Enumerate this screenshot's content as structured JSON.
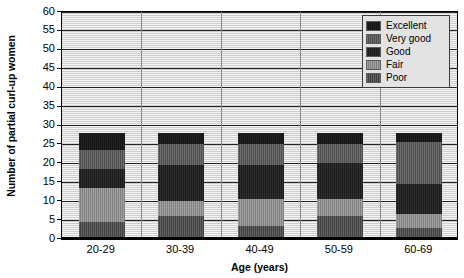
{
  "chart_data": {
    "type": "bar",
    "subtype": "stacked-bar",
    "title": "",
    "xlabel": "Age (years)",
    "ylabel": "Number of partial curl-up women",
    "categories": [
      "20-29",
      "30-39",
      "40-49",
      "50-59",
      "60-69"
    ],
    "ylim": [
      0,
      60
    ],
    "ytick_labels": [
      "0",
      "5",
      "10",
      "15",
      "20",
      "25",
      "30",
      "35",
      "40",
      "45",
      "50",
      "55",
      "60"
    ],
    "ytick_values": [
      0,
      5,
      10,
      15,
      20,
      25,
      30,
      35,
      40,
      45,
      50,
      55,
      60
    ],
    "grid": true,
    "grid_axis": "y",
    "legend_position": "top-right",
    "series": [
      {
        "name": "Poor",
        "color": "#4a4a4a",
        "values": [
          4.0,
          5.5,
          3.0,
          5.5,
          2.5
        ]
      },
      {
        "name": "Fair",
        "color": "#8e8e8e",
        "values": [
          9.0,
          4.0,
          7.0,
          4.5,
          3.5
        ]
      },
      {
        "name": "Good",
        "color": "#1d1d1d",
        "values": [
          5.0,
          9.5,
          9.0,
          9.5,
          8.0
        ]
      },
      {
        "name": "Very good",
        "color": "#565656",
        "values": [
          5.0,
          5.5,
          5.5,
          5.0,
          11.0
        ]
      },
      {
        "name": "Excellent",
        "color": "#151515",
        "values": [
          4.5,
          3.0,
          3.0,
          3.0,
          2.5
        ]
      }
    ],
    "stack_order_bottom_to_top": [
      "Poor",
      "Fair",
      "Good",
      "Very good",
      "Excellent"
    ],
    "totals": [
      27.5,
      27.5,
      27.5,
      27.5,
      27.5
    ],
    "cumulative_tops": {
      "20-29": {
        "Poor": 4.0,
        "Fair": 13.0,
        "Good": 18.0,
        "Very good": 23.0,
        "Excellent": 27.5
      },
      "30-39": {
        "Poor": 5.5,
        "Fair": 9.5,
        "Good": 19.0,
        "Very good": 24.5,
        "Excellent": 27.5
      },
      "40-49": {
        "Poor": 3.0,
        "Fair": 10.0,
        "Good": 19.0,
        "Very good": 24.5,
        "Excellent": 27.5
      },
      "50-59": {
        "Poor": 5.5,
        "Fair": 10.0,
        "Good": 19.5,
        "Very good": 24.5,
        "Excellent": 27.5
      },
      "60-69": {
        "Poor": 2.5,
        "Fair": 6.0,
        "Good": 14.0,
        "Very good": 25.0,
        "Excellent": 27.5
      }
    }
  },
  "legend": {
    "items": [
      {
        "label": "Excellent",
        "color": "#151515",
        "fill_class": "fill-excellent"
      },
      {
        "label": "Very good",
        "color": "#565656",
        "fill_class": "fill-verygood"
      },
      {
        "label": "Good",
        "color": "#1d1d1d",
        "fill_class": "fill-good"
      },
      {
        "label": "Fair",
        "color": "#8e8e8e",
        "fill_class": "fill-fair"
      },
      {
        "label": "Poor",
        "color": "#4a4a4a",
        "fill_class": "fill-poor"
      }
    ]
  },
  "axes": {
    "y_title": "Number of partial curl-up women",
    "x_title": "Age (years)"
  },
  "colors": {
    "plot_background": "#e9e9e9",
    "axis": "#000000",
    "gridline": "#000000",
    "legend_background": "#e3e3e3",
    "legend_border": "#3b3b3b"
  }
}
